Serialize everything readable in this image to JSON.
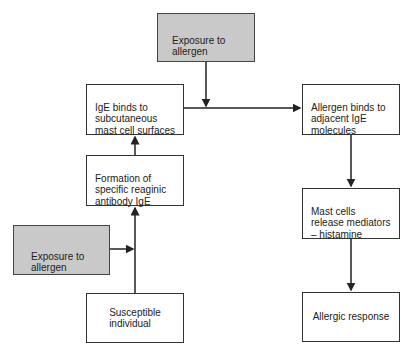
{
  "diagram": {
    "nodes": {
      "exposure_top": {
        "label": "Exposure to\nallergen"
      },
      "ige_binds": {
        "label": "IgE binds to\nsubcutaneous\nmast cell surfaces"
      },
      "allergen_binds": {
        "label": "Allergen binds to\nadjacent IgE\nmolecules"
      },
      "formation": {
        "label": "Formation of\nspecific reaginic\nantibody IgE"
      },
      "exposure_left": {
        "label": "Exposure to\nallergen"
      },
      "mast_cells": {
        "label": "Mast cells\nrelease mediators\n– histamine"
      },
      "susceptible": {
        "label": "Susceptible\nindividual"
      },
      "allergic_response": {
        "label": "Allergic response"
      }
    },
    "edges": [
      {
        "from": "susceptible",
        "to": "formation"
      },
      {
        "from": "exposure_left",
        "to": "formation"
      },
      {
        "from": "formation",
        "to": "ige_binds"
      },
      {
        "from": "ige_binds",
        "to": "allergen_binds"
      },
      {
        "from": "exposure_top",
        "to": "allergen_binds"
      },
      {
        "from": "allergen_binds",
        "to": "mast_cells"
      },
      {
        "from": "mast_cells",
        "to": "allergic_response"
      }
    ],
    "colors": {
      "gray_fill": "#c9c9c9",
      "line": "#222222"
    }
  }
}
